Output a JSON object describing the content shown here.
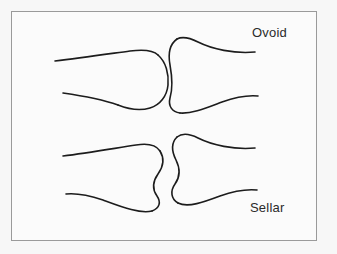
{
  "figure": {
    "background_color": "#f7f7f7",
    "panel_color": "#fbfbfb",
    "border_color": "#9a9a9a",
    "stroke_color": "#1c1c1c",
    "width": 337,
    "height": 254
  },
  "diagrams": [
    {
      "id": "ovoid",
      "label": "Ovoid",
      "description": "Ovoid joint: convex egg-shaped head of left bone articulating with concave socket of right bone",
      "left_bone": {
        "name": "ovoid-convex-bone",
        "end_shape": "convex",
        "upper_shaft_path": "M 55 61 C 80 58, 108 54, 130 51 C 145 49, 153 50, 158 55",
        "head_path": "M 158 55 C 166 62, 169 74, 168 85 C 167 96, 160 105, 150 108 C 140 111, 128 109, 118 105",
        "lower_shaft_path": "M 118 105 C 104 100, 84 96, 63 93"
      },
      "right_bone": {
        "name": "ovoid-concave-bone",
        "end_shape": "concave",
        "upper_shaft_path": "M 255 52 C 234 54, 212 49, 198 42 C 190 38, 183 36, 177 39",
        "socket_path": "M 177 39 C 170 44, 168 54, 170 65 C 172 76, 173 88, 170 98 C 168 106, 172 112, 180 113",
        "lower_shaft_path": "M 180 113 C 192 114, 206 108, 222 102 C 236 97, 248 95, 258 96"
      }
    },
    {
      "id": "sellar",
      "label": "Sellar",
      "description": "Sellar (saddle) joint: two bones with complementary S-shaped curved ends that interlock",
      "left_bone": {
        "name": "sellar-saddle-bone-left",
        "end_shape": "s-curve",
        "upper_shaft_path": "M 63 156 C 88 153, 116 148, 136 145 C 148 143, 156 145, 160 151",
        "end_path": "M 160 151 C 165 159, 163 167, 158 174 C 153 181, 152 189, 157 196 C 161 202, 160 208, 152 211",
        "lower_shaft_path": "M 152 211 C 140 214, 122 207, 103 200 C 88 195, 75 193, 66 194"
      },
      "right_bone": {
        "name": "sellar-saddle-bone-right",
        "end_shape": "s-curve",
        "upper_shaft_path": "M 255 148 C 234 150, 212 145, 198 138 C 190 134, 182 133, 177 137",
        "end_path": "M 177 137 C 171 143, 172 152, 176 160 C 180 168, 180 177, 175 184 C 170 191, 171 199, 178 203",
        "lower_shaft_path": "M 178 203 C 188 208, 204 202, 220 196 C 234 191, 247 189, 257 190"
      }
    }
  ]
}
